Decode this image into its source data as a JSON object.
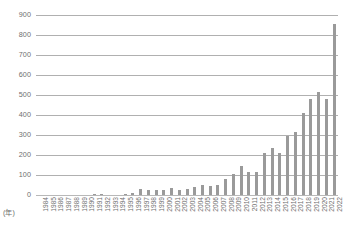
{
  "chart_data": {
    "type": "bar",
    "title": "",
    "subtitle": "",
    "xlabel": "(年)",
    "ylabel": "",
    "ylim": [
      0,
      900
    ],
    "ytick_step": 100,
    "yticks": [
      900,
      800,
      700,
      600,
      500,
      400,
      300,
      200,
      100,
      0
    ],
    "grid": true,
    "legend": null,
    "bar_color": "#9a9a9a",
    "gridline_color": "#b0b0b0",
    "text_color": "#6e6e6e",
    "background_color": "#ffffff",
    "categories": [
      "1984",
      "1985",
      "1986",
      "1987",
      "1988",
      "1989",
      "1990",
      "1991",
      "1992",
      "1993",
      "1994",
      "1995",
      "1996",
      "1997",
      "1998",
      "1999",
      "2000",
      "2001",
      "2002",
      "2003",
      "2004",
      "2005",
      "2006",
      "2007",
      "2008",
      "2009",
      "2010",
      "2011",
      "2012",
      "2013",
      "2014",
      "2015",
      "2016",
      "2017",
      "2018",
      "2019",
      "2020",
      "2021",
      "2022"
    ],
    "values": [
      0,
      0,
      0,
      0,
      0,
      0,
      0,
      2,
      2,
      1,
      1,
      2,
      8,
      28,
      25,
      24,
      26,
      36,
      26,
      32,
      42,
      50,
      47,
      50,
      82,
      103,
      145,
      117,
      113,
      208,
      236,
      210,
      295,
      317,
      410,
      482,
      513,
      481,
      855
    ],
    "annotations": []
  }
}
